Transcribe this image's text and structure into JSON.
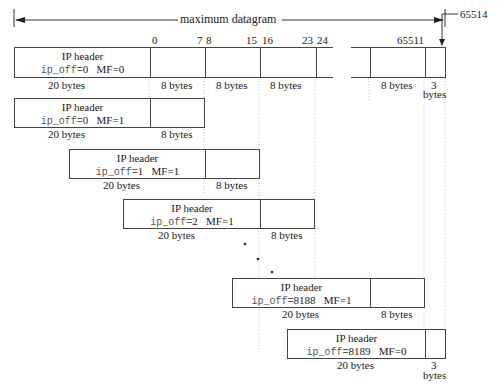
{
  "title": "maximum datagram",
  "top_offsets": {
    "o0": "0",
    "o7": "7",
    "o8": "8",
    "o15": "15",
    "o16": "16",
    "o23": "23",
    "o24": "24",
    "o65511": "65511",
    "o65514": "65514"
  },
  "header_label": "IP header",
  "off_label": "ip_off",
  "fragments": [
    {
      "off": "0",
      "mf": "MF=0",
      "hdr_bytes": "20 bytes",
      "data_bytes": "8 bytes"
    },
    {
      "off": "0",
      "mf": "MF=1",
      "hdr_bytes": "20 bytes",
      "data_bytes": "8 bytes"
    },
    {
      "off": "1",
      "mf": "MF=1",
      "hdr_bytes": "20 bytes",
      "data_bytes": "8 bytes"
    },
    {
      "off": "2",
      "mf": "MF=1",
      "hdr_bytes": "20 bytes",
      "data_bytes": "8 bytes"
    },
    {
      "off": "8188",
      "mf": "MF=1",
      "hdr_bytes": "20 bytes",
      "data_bytes": "8 bytes"
    },
    {
      "off": "8189",
      "mf": "MF=0",
      "hdr_bytes": "20 bytes",
      "data_bytes_1": "3",
      "data_bytes_2": "bytes"
    }
  ],
  "top_bytes": {
    "b1": "8 bytes",
    "b2": "8 bytes",
    "b3": "8 bytes",
    "b4": "8 bytes",
    "b5a": "3",
    "b5b": "bytes"
  }
}
